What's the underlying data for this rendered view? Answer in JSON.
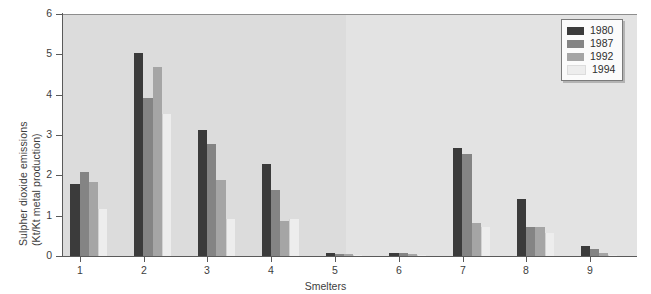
{
  "chart_data": {
    "type": "bar",
    "title": "",
    "subtitle": "",
    "xlabel": "Smelters",
    "ylabel_line1": "Sulpher dioxide emissions",
    "ylabel_line2": "(Kt/Kt metal production)",
    "categories": [
      "1",
      "2",
      "3",
      "4",
      "5",
      "6",
      "7",
      "8",
      "9"
    ],
    "ylim": [
      0,
      6
    ],
    "yticks": [
      0,
      1,
      2,
      3,
      4,
      5,
      6
    ],
    "ytick_labels": [
      "0",
      "1",
      "2",
      "3",
      "4",
      "5",
      "6"
    ],
    "grid": false,
    "legend_position": "top-right",
    "series": [
      {
        "name": "1980",
        "color": "#3b3b3b",
        "values": [
          1.8,
          5.05,
          3.15,
          2.3,
          0.09,
          0.11,
          2.7,
          1.45,
          0.28
        ]
      },
      {
        "name": "1987",
        "color": "#848484",
        "values": [
          2.1,
          3.95,
          2.8,
          1.65,
          0.08,
          0.09,
          2.55,
          0.75,
          0.2
        ]
      },
      {
        "name": "1992",
        "color": "#a5a5a5",
        "values": [
          1.85,
          4.7,
          1.9,
          0.9,
          0.07,
          0.08,
          0.85,
          0.75,
          0.1
        ]
      },
      {
        "name": "1994",
        "color": "#ededed",
        "values": [
          1.2,
          3.55,
          0.95,
          0.95,
          0.06,
          0.05,
          0.75,
          0.6,
          0.05
        ]
      }
    ]
  },
  "legend": {
    "items": [
      {
        "label": "1980",
        "color": "#3b3b3b"
      },
      {
        "label": "1987",
        "color": "#848484"
      },
      {
        "label": "1992",
        "color": "#a5a5a5"
      },
      {
        "label": "1994",
        "color": "#ededed"
      }
    ]
  },
  "colors": {
    "plot_background": "#dedede",
    "axis": "#5a5a5a",
    "text": "#3d3d3d",
    "legend_background": "#fbfbfb",
    "legend_border": "#7a7a7a"
  }
}
